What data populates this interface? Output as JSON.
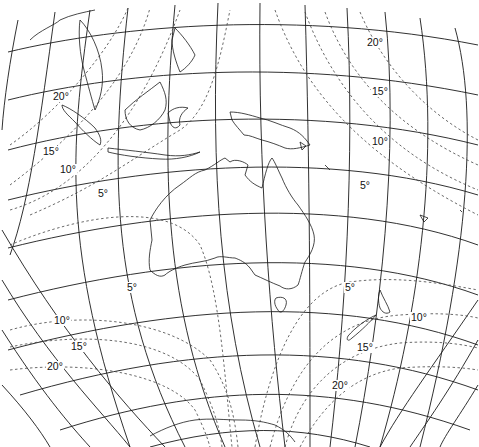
{
  "map": {
    "type": "map-projection-distortion",
    "region": "Australia / Southeast Asia / Southwest Pacific",
    "isoline_units": "degrees",
    "labels": {
      "upper_left": [
        {
          "text": "20°",
          "x": 52,
          "y": 91
        },
        {
          "text": "15°",
          "x": 42,
          "y": 146
        },
        {
          "text": "10°",
          "x": 59,
          "y": 164
        },
        {
          "text": "5°",
          "x": 97,
          "y": 188
        }
      ],
      "upper_right": [
        {
          "text": "20°",
          "x": 366,
          "y": 37
        },
        {
          "text": "15°",
          "x": 371,
          "y": 86
        },
        {
          "text": "10°",
          "x": 371,
          "y": 136
        },
        {
          "text": "5°",
          "x": 359,
          "y": 180
        }
      ],
      "lower_left": [
        {
          "text": "5°",
          "x": 126,
          "y": 282
        },
        {
          "text": "10°",
          "x": 53,
          "y": 315
        },
        {
          "text": "15°",
          "x": 70,
          "y": 341
        },
        {
          "text": "20°",
          "x": 46,
          "y": 361
        }
      ],
      "lower_right": [
        {
          "text": "5°",
          "x": 344,
          "y": 282
        },
        {
          "text": "10°",
          "x": 410,
          "y": 312
        },
        {
          "text": "15°",
          "x": 356,
          "y": 342
        },
        {
          "text": "20°",
          "x": 331,
          "y": 380
        }
      ]
    },
    "colors": {
      "graticule": "#1a1a1a",
      "isolines": "#444444",
      "coastline": "#1a1a1a",
      "background": "#ffffff"
    }
  }
}
